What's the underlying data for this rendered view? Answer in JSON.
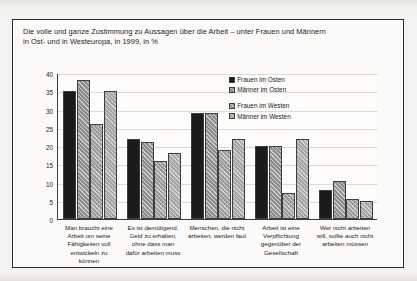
{
  "title": {
    "line1": "Die volle und ganze Zustimmung zu Aussagen über die Arbeit – unter Frauen und Männern",
    "line2": "in Ost- und in Westeuropa, in 1999, in %"
  },
  "chart_data": {
    "type": "bar",
    "title": "Die volle und ganze Zustimmung zu Aussagen über die Arbeit – unter Frauen und Männern in Ost- und in Westeuropa, in 1999, in %",
    "xlabel": "",
    "ylabel": "",
    "ylim": [
      0,
      40
    ],
    "yticks": [
      0,
      5,
      10,
      15,
      20,
      25,
      30,
      35,
      40
    ],
    "ytick_labels": [
      "0",
      "5",
      "10",
      "15",
      "20",
      "25",
      "30",
      "35",
      "40"
    ],
    "grid": true,
    "legend_position": "top-right",
    "categories": [
      "Man braucht eine Arbeit um seine Fähigkeiten voll entwickeln zu können",
      "Es ist demütigend, Geld zu erhalten, ohne dass man dafür arbeiten muss",
      "Menschen, die nicht arbeiten, werden faul",
      "Arbeit ist eine Verpflichtung gegenüber der Gesellschaft",
      "Wer nicht arbeiten will, sollte auch nicht arbeiten müssen"
    ],
    "category_lines": [
      [
        "Man braucht eine",
        "Arbeit um seine",
        "Fähigkeiten voll",
        "entwickeln zu",
        "können"
      ],
      [
        "Es ist demütigend,",
        "Geld zu erhalten,",
        "ohne dass man",
        "dafür arbeiten muss"
      ],
      [
        "Menschen, die nicht",
        "arbeiten, werden faul"
      ],
      [
        "Arbeit ist eine",
        "Verpflichtung",
        "gegenüber der",
        "Gesellschaft"
      ],
      [
        "Wer nicht arbeiten",
        "will, sollte auch nicht",
        "arbeiten müssen"
      ]
    ],
    "series": [
      {
        "name": "Frauen im Osten",
        "values": [
          35,
          22,
          29,
          20,
          8
        ]
      },
      {
        "name": "Männer im Osten",
        "values": [
          38,
          21,
          29,
          20,
          10.5
        ]
      },
      {
        "name": "Frauen im Westen",
        "values": [
          26,
          16,
          19,
          7,
          5.5
        ]
      },
      {
        "name": "Männer im Westen",
        "values": [
          35,
          18,
          22,
          22,
          5
        ]
      }
    ]
  }
}
